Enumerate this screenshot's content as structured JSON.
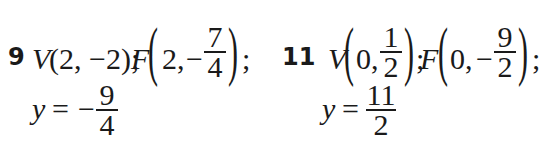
{
  "problems": [
    {
      "number": "9",
      "vertex_label": "V",
      "vertex_text": "(2, −2);",
      "focus_label": "F",
      "focus_x": "2,",
      "focus_y_sign": "−",
      "focus_y_num": "7",
      "focus_y_den": "4",
      "focus_close": ";",
      "directrix_var": "y",
      "directrix_eq": "=",
      "directrix_sign": "−",
      "directrix_num": "9",
      "directrix_den": "4"
    },
    {
      "number": "11",
      "vertex_label": "V",
      "vertex_x": "0,",
      "vertex_y_num": "1",
      "vertex_y_den": "2",
      "vertex_close": ";",
      "focus_label": "F",
      "focus_x": "0,",
      "focus_y_sign": "−",
      "focus_y_num": "9",
      "focus_y_den": "2",
      "focus_close": ";",
      "directrix_var": "y",
      "directrix_eq": "=",
      "directrix_num": "11",
      "directrix_den": "2"
    }
  ],
  "parens": {
    "open": "(",
    "close": ")"
  }
}
